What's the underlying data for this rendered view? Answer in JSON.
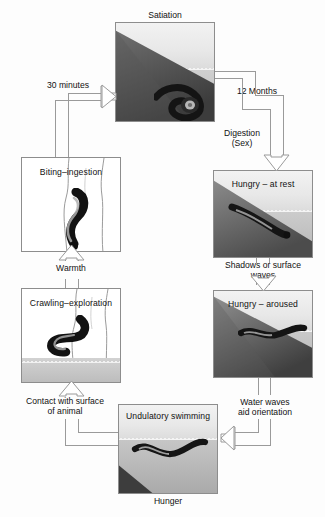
{
  "figure": {
    "type": "cycle-diagram"
  },
  "nodes": {
    "satiation": {
      "caption": "Satiation",
      "caption_position": "above",
      "scene": "leech coiled at rest on submerged dark bank"
    },
    "hungry_at_rest": {
      "caption": "Hungry – at rest",
      "caption_position": "inside-top",
      "scene": "leech resting on sloping bank at the waterline"
    },
    "hungry_aroused": {
      "caption": "Hungry – aroused",
      "caption_position": "inside-top",
      "scene": "leech extended at the water surface over a dark bank"
    },
    "undulatory_swimming": {
      "caption": "Undulatory swimming",
      "caption_position": "inside-top",
      "below_caption": "Hunger",
      "scene": "leech swimming with undulating body just under the surface"
    },
    "crawling_exploration": {
      "caption": "Crawling–exploration",
      "caption_position": "inside-top",
      "scene": "leech crawling up a human leg at the water's edge"
    },
    "biting_ingestion": {
      "caption": "Biting–ingestion",
      "caption_position": "inside-top",
      "scene": "leech attached and feeding on a human leg"
    }
  },
  "edges": [
    {
      "id": "e1",
      "label": "30 minutes",
      "from": "biting_ingestion",
      "to": "satiation"
    },
    {
      "id": "e2",
      "label": "12 Months",
      "from": "satiation",
      "to": "hungry_at_rest"
    },
    {
      "id": "e3",
      "label": "Digestion\n(Sex)",
      "label_line1": "Digestion",
      "label_line2": "(Sex)",
      "from": "satiation",
      "to": "hungry_at_rest"
    },
    {
      "id": "e4",
      "label": "Shadows or surface waves",
      "label_line1": "Shadows or surface",
      "label_line2": "waves",
      "from": "hungry_at_rest",
      "to": "hungry_aroused"
    },
    {
      "id": "e5",
      "label": "Water waves aid orientation",
      "label_line1": "Water waves",
      "label_line2": "aid orientation",
      "from": "hungry_aroused",
      "to": "undulatory_swimming"
    },
    {
      "id": "e6",
      "label": "Contact with surface of animal",
      "label_line1": "Contact with surface",
      "label_line2": "of animal",
      "from": "undulatory_swimming",
      "to": "crawling_exploration"
    },
    {
      "id": "e7",
      "label": "Warmth",
      "from": "crawling_exploration",
      "to": "biting_ingestion"
    }
  ],
  "colors": {
    "line": "#9a9a9a",
    "text": "#111111",
    "panel_border": "#8d8d8d",
    "water": "#b9b9b9",
    "bank_dark": "#4a4a4a",
    "leech": "#111111",
    "background": "#fdfdfd"
  }
}
